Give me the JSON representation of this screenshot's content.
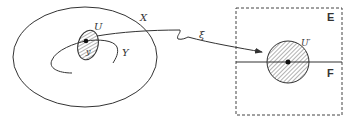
{
  "diagram": {
    "type": "manifold-chart-mapping",
    "labels": {
      "manifold": "X",
      "submanifold": "Y",
      "neighborhood": "U",
      "point": "y",
      "chart_map": "ξ",
      "image_neighborhood": "U′",
      "ambient_space": "E",
      "subspace": "F"
    },
    "colors": {
      "stroke": "#333333",
      "hatch": "#555555",
      "box_dash": "#444444",
      "background": "#ffffff"
    }
  }
}
